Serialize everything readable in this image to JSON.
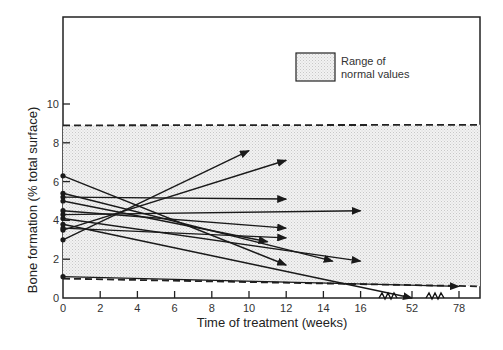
{
  "chart_data": {
    "type": "line",
    "title": "",
    "xlabel": "Time of treatment (weeks)",
    "ylabel": "Bone formation (% total surface)",
    "x_ticks": [
      "0",
      "2",
      "4",
      "6",
      "8",
      "10",
      "12",
      "14",
      "16",
      "52",
      "78"
    ],
    "y_ticks": [
      "0",
      "2",
      "4",
      "6",
      "8",
      "10"
    ],
    "xlim": [
      0,
      78
    ],
    "ylim": [
      0,
      10
    ],
    "axis_break": "16 to 52 and 52 to 78 weeks (broken axis)",
    "legend": {
      "label_line1": "Range of",
      "label_line2": "normal values"
    },
    "normal_range": {
      "lower": 1.0,
      "upper": 8.9
    },
    "series": [
      {
        "name": "patient-1",
        "x": [
          0,
          10
        ],
        "y": [
          3.0,
          7.6
        ]
      },
      {
        "name": "patient-2",
        "x": [
          0,
          12
        ],
        "y": [
          3.5,
          7.1
        ]
      },
      {
        "name": "patient-3",
        "x": [
          0,
          12
        ],
        "y": [
          5.2,
          5.1
        ]
      },
      {
        "name": "patient-4",
        "x": [
          0,
          16
        ],
        "y": [
          4.3,
          4.5
        ]
      },
      {
        "name": "patient-5",
        "x": [
          0,
          12
        ],
        "y": [
          4.5,
          3.6
        ]
      },
      {
        "name": "patient-6",
        "x": [
          0,
          12
        ],
        "y": [
          3.6,
          3.1
        ]
      },
      {
        "name": "patient-7",
        "x": [
          0,
          11
        ],
        "y": [
          5.0,
          2.9
        ]
      },
      {
        "name": "patient-8",
        "x": [
          0,
          14.5
        ],
        "y": [
          5.4,
          1.9
        ]
      },
      {
        "name": "patient-9",
        "x": [
          0,
          16
        ],
        "y": [
          4.1,
          1.9
        ]
      },
      {
        "name": "patient-10",
        "x": [
          0,
          12
        ],
        "y": [
          6.3,
          1.7
        ]
      },
      {
        "name": "patient-11",
        "x": [
          0,
          52
        ],
        "y": [
          3.8,
          0.0
        ]
      },
      {
        "name": "patient-12",
        "x": [
          0,
          78
        ],
        "y": [
          1.1,
          0.6
        ]
      }
    ]
  }
}
